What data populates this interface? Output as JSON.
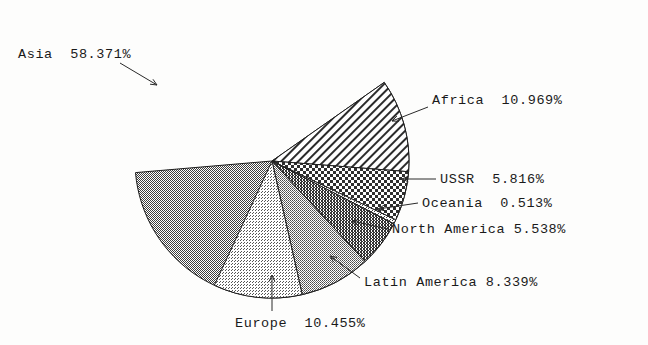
{
  "chart_data": {
    "type": "pie",
    "title": "",
    "subtitle": "",
    "xlabel": "",
    "ylabel": "",
    "legend_position": "none",
    "grid": false,
    "units": "percent",
    "categories": [
      "Asia",
      "Africa",
      "USSR",
      "Oceania",
      "North America",
      "Latin America",
      "Europe"
    ],
    "values": [
      58.371,
      10.969,
      5.816,
      0.513,
      5.538,
      8.339,
      10.455
    ],
    "slices": [
      {
        "name": "Asia",
        "value": 58.371,
        "label_text": "Asia  58.371%",
        "value_text": "58.371%",
        "fill_style": "dither-50",
        "color": "#8a8a8a",
        "start_angle_deg": 35.0,
        "sweep_deg": 210.14,
        "label_x": 18,
        "label_y": 47,
        "leader": {
          "x1": 120,
          "y1": 63,
          "x2": 157,
          "y2": 85
        }
      },
      {
        "name": "Africa",
        "value": 10.969,
        "label_text": "Africa  10.969%",
        "value_text": "10.969%",
        "fill_style": "diagonal-hatch",
        "color": "#ffffff",
        "start_angle_deg": 35.0,
        "sweep_deg": 39.49,
        "label_x": 432,
        "label_y": 93,
        "leader": {
          "x1": 428,
          "y1": 107,
          "x2": 392,
          "y2": 121
        }
      },
      {
        "name": "USSR",
        "value": 5.816,
        "label_text": "USSR  5.816%",
        "value_text": "5.816%",
        "fill_style": "checker-coarse",
        "color": "#ffffff",
        "start_angle_deg": -4.49,
        "sweep_deg": 20.94,
        "label_x": 440,
        "label_y": 172,
        "leader": {
          "x1": 436,
          "y1": 179,
          "x2": 402,
          "y2": 179
        }
      },
      {
        "name": "Oceania",
        "value": 0.513,
        "label_text": "Oceania  0.513%",
        "value_text": "0.513%",
        "fill_style": "dither-25",
        "color": "#c9c9c9",
        "start_angle_deg": -25.43,
        "sweep_deg": 1.85,
        "label_x": 422,
        "label_y": 196,
        "leader": {
          "x1": 418,
          "y1": 203,
          "x2": 378,
          "y2": 209
        }
      },
      {
        "name": "North America",
        "value": 5.538,
        "label_text": "North America 5.538%",
        "value_text": "5.538%",
        "fill_style": "dither-65",
        "color": "#777777",
        "start_angle_deg": -27.28,
        "sweep_deg": 19.94,
        "label_x": 392,
        "label_y": 222,
        "leader": {
          "x1": 388,
          "y1": 229,
          "x2": 352,
          "y2": 221
        }
      },
      {
        "name": "Latin America",
        "value": 8.339,
        "label_text": "Latin America 8.339%",
        "value_text": "8.339%",
        "fill_style": "dither-45",
        "color": "#9d9d9d",
        "start_angle_deg": -47.22,
        "sweep_deg": 30.02,
        "label_x": 364,
        "label_y": 275,
        "leader": {
          "x1": 360,
          "y1": 278,
          "x2": 330,
          "y2": 256
        }
      },
      {
        "name": "Europe",
        "value": 10.455,
        "label_text": "Europe  10.455%",
        "value_text": "10.455%",
        "fill_style": "dither-20",
        "color": "#d4d4d4",
        "start_angle_deg": -77.24,
        "sweep_deg": 37.64,
        "label_x": 235,
        "label_y": 316,
        "leader": {
          "x1": 272,
          "y1": 311,
          "x2": 272,
          "y2": 275
        }
      }
    ],
    "geometry": {
      "center_x": 272,
      "center_y": 161,
      "radius": 137
    }
  }
}
